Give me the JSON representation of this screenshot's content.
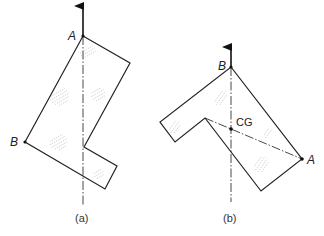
{
  "figure_a": {
    "caption": "(a)",
    "labels": {
      "top_point": "A",
      "left_point": "B"
    },
    "pivot": [
      83,
      36
    ],
    "arrow_tip": [
      83,
      4
    ],
    "axis_end": [
      83,
      205
    ],
    "outline": [
      [
        83,
        36
      ],
      [
        130,
        63
      ],
      [
        84,
        147
      ],
      [
        117,
        166
      ],
      [
        105,
        189
      ],
      [
        25,
        142
      ]
    ]
  },
  "figure_b": {
    "caption": "(b)",
    "labels": {
      "top_point": "B",
      "right_point": "A",
      "center": "CG"
    },
    "pivot": [
      231,
      67
    ],
    "arrow_tip": [
      231,
      45
    ],
    "axis_end": [
      231,
      202
    ],
    "cg": [
      231,
      129
    ],
    "outline": [
      [
        231,
        67
      ],
      [
        302,
        159
      ],
      [
        261,
        191
      ],
      [
        205,
        118
      ],
      [
        175,
        142
      ],
      [
        160,
        122
      ]
    ]
  }
}
